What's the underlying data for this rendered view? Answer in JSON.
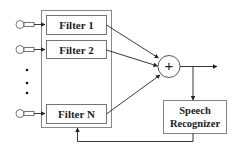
{
  "diagram": {
    "filters": [
      {
        "label": "Filter 1"
      },
      {
        "label": "Filter 2"
      },
      {
        "label": "Filter N"
      }
    ],
    "summer_symbol": "+",
    "recognizer": {
      "line1": "Speech",
      "line2": "Recognizer"
    },
    "ellipsis_icon": "vertical-dots",
    "input_icon": "microphone-icon",
    "colors": {
      "stroke": "#333333",
      "box_border": "#888888",
      "background": "#ffffff"
    }
  }
}
